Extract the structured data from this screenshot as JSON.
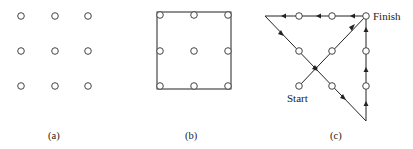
{
  "figure": {
    "panels": [
      {
        "id": "a",
        "caption": "(a)",
        "description": "3x3 grid of dots",
        "dots": [
          [
            21,
            16
          ],
          [
            55,
            16
          ],
          [
            88,
            16
          ],
          [
            21,
            51
          ],
          [
            55,
            51
          ],
          [
            88,
            51
          ],
          [
            21,
            86
          ],
          [
            55,
            86
          ],
          [
            88,
            86
          ]
        ]
      },
      {
        "id": "b",
        "caption": "(b)",
        "description": "3x3 grid of dots enclosed by a square",
        "dots": [
          [
            160,
            15
          ],
          [
            194,
            15
          ],
          [
            228,
            15
          ],
          [
            160,
            51
          ],
          [
            194,
            51
          ],
          [
            228,
            51
          ],
          [
            160,
            86
          ],
          [
            194,
            86
          ],
          [
            228,
            86
          ]
        ],
        "square": {
          "x": 157,
          "y": 12,
          "w": 74,
          "h": 77
        }
      },
      {
        "id": "c",
        "caption": "(c)",
        "description": "Four connected straight lines passing through all nine dots",
        "dots": [
          [
            299,
            16
          ],
          [
            332,
            16
          ],
          [
            366,
            16
          ],
          [
            299,
            51
          ],
          [
            332,
            51
          ],
          [
            366,
            51
          ],
          [
            299,
            86
          ],
          [
            332,
            86
          ],
          [
            366,
            86
          ]
        ],
        "path": [
          [
            299,
            86
          ],
          [
            366,
            16
          ],
          [
            265,
            16
          ],
          [
            366,
            121
          ],
          [
            366,
            16
          ]
        ],
        "start_label": "Start",
        "finish_label": "Finish"
      }
    ]
  },
  "colors": {
    "stroke": "#222222",
    "background": "#ffffff"
  }
}
